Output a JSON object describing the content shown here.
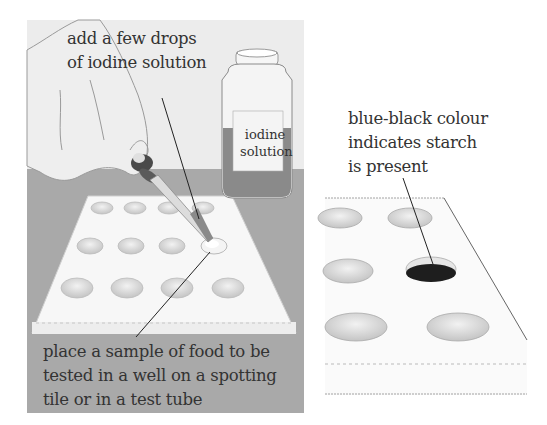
{
  "left_panel": {
    "callout_top": "add a few drops\nof iodine solution",
    "callout_bottom": "place a sample of food to be\ntested in a well on a spotting\ntile or in a test tube",
    "bottle_label": "iodine\nsolution"
  },
  "right_panel": {
    "callout": "blue-black colour\nindicates starch\nis present"
  },
  "colors": {
    "background": "#ececec",
    "table": "#a9a9a9",
    "tile": "#f7f7f7",
    "well": "#d8d8d8",
    "positive_well": "#1e1e1e",
    "iodine": "#8a8a8a",
    "text": "#333333"
  }
}
